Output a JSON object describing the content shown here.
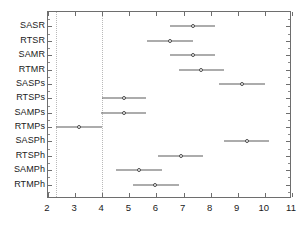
{
  "chart_data": {
    "type": "scatter",
    "title": "",
    "subtitle": "",
    "xlabel": "",
    "ylabel": "",
    "xlim": [
      2,
      11
    ],
    "ylim": [
      0,
      13
    ],
    "grid": true,
    "gridlines_x": [
      2.3,
      4.0
    ],
    "legend": null,
    "legend_position": "none",
    "xticks": [
      2,
      3,
      4,
      5,
      6,
      7,
      8,
      9,
      10,
      11
    ],
    "xticklabels": [
      "2",
      "3",
      "4",
      "5",
      "6",
      "7",
      "8",
      "9",
      "10",
      "11"
    ],
    "categories": [
      "SASR",
      "RTSR",
      "SAMR",
      "RTMR",
      "SASPs",
      "RTSPs",
      "SAMPs",
      "RTMPs",
      "SASPh",
      "RTSPh",
      "SAMPh",
      "RTMPh"
    ],
    "series": [
      {
        "name": "mean",
        "values": [
          7.35,
          6.5,
          7.35,
          7.65,
          9.15,
          4.8,
          4.8,
          3.15,
          9.35,
          6.9,
          5.35,
          5.95
        ]
      },
      {
        "name": "ci_lower",
        "values": [
          6.5,
          5.65,
          6.5,
          6.85,
          8.3,
          4.0,
          3.95,
          2.3,
          8.5,
          6.05,
          4.5,
          5.15
        ]
      },
      {
        "name": "ci_upper",
        "values": [
          8.15,
          7.35,
          8.15,
          8.5,
          10.0,
          5.6,
          5.6,
          4.0,
          10.15,
          7.7,
          6.2,
          6.85
        ]
      }
    ],
    "points": [
      {
        "label": "SASR",
        "mean": 7.35,
        "ci_lower": 6.5,
        "ci_upper": 8.15
      },
      {
        "label": "RTSR",
        "mean": 6.5,
        "ci_lower": 5.65,
        "ci_upper": 7.35
      },
      {
        "label": "SAMR",
        "mean": 7.35,
        "ci_lower": 6.5,
        "ci_upper": 8.15
      },
      {
        "label": "RTMR",
        "mean": 7.65,
        "ci_lower": 6.85,
        "ci_upper": 8.5
      },
      {
        "label": "SASPs",
        "mean": 9.15,
        "ci_lower": 8.3,
        "ci_upper": 10.0
      },
      {
        "label": "RTSPs",
        "mean": 4.8,
        "ci_lower": 4.0,
        "ci_upper": 5.6
      },
      {
        "label": "SAMPs",
        "mean": 4.8,
        "ci_lower": 3.95,
        "ci_upper": 5.6
      },
      {
        "label": "RTMPs",
        "mean": 3.15,
        "ci_lower": 2.3,
        "ci_upper": 4.0
      },
      {
        "label": "SASPh",
        "mean": 9.35,
        "ci_lower": 8.5,
        "ci_upper": 10.15
      },
      {
        "label": "RTSPh",
        "mean": 6.9,
        "ci_lower": 6.05,
        "ci_upper": 7.7
      },
      {
        "label": "SAMPh",
        "mean": 5.35,
        "ci_lower": 4.5,
        "ci_upper": 6.2
      },
      {
        "label": "RTMPh",
        "mean": 5.95,
        "ci_lower": 5.15,
        "ci_upper": 6.85
      }
    ],
    "colors": {
      "line": "#5a5a5a",
      "marker_edge": "#4a4a4a",
      "marker_face": "#ffffff",
      "axis": "#6e6e6e",
      "grid": "#b9b9b9",
      "text": "#1a1a1a",
      "background": "#ffffff"
    }
  }
}
